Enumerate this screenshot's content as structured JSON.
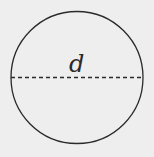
{
  "diagram": {
    "shape": "circle",
    "center": [
      77,
      77
    ],
    "radius": 66,
    "diameter_line": {
      "style": "dashed",
      "y": 77.5,
      "x1": 11,
      "x2": 143
    },
    "label": "d",
    "colors": {
      "background": "#eeeeee",
      "stroke": "#2a2a2a"
    }
  }
}
